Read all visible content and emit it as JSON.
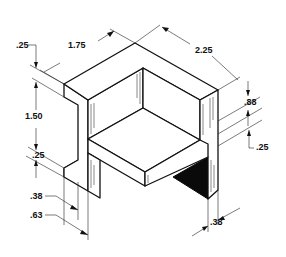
{
  "figure": {
    "type": "isometric technical drawing",
    "colors": {
      "line": "#111111",
      "background": "#ffffff",
      "shadow": "#0a0a0a"
    }
  },
  "dimensions": {
    "top_thickness": ".25",
    "depth": "1.75",
    "width": "2.25",
    "height": "1.50",
    "shelf_thickness": ".25",
    "right_height": ".88",
    "right_shelf_thickness": ".25",
    "leg_inner": ".38",
    "leg_outer": ".63",
    "right_leg": ".38"
  }
}
